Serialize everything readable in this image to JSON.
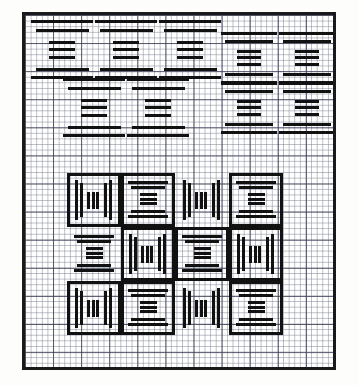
{
  "document": {
    "kind": "scanned-resolution-test-chart",
    "title": "Resolution Test Chart",
    "background_color": "#ffffff",
    "ink_color": "#111111",
    "paper": {
      "type": "graph-paper",
      "minor_grid_color": "#787d8c",
      "major_grid_color": "#3c4155",
      "minor_cell_px": 5.62,
      "major_cell_px": 28.1,
      "minor_per_major": 5
    },
    "frame": {
      "border_color": "#1a1a1a",
      "border_width_px": 3,
      "x": 22,
      "y": 12,
      "width": 314,
      "height": 358
    }
  },
  "chart_data": {
    "type": "table",
    "title": "Resolution Test Chart",
    "xlabel": "",
    "ylabel": "",
    "groups": [
      {
        "name": "upper-bar-field",
        "description": "Five I-beam bar targets arranged in an upper field; left cluster of three over two, right cluster of two tall stacked pairs.",
        "targets": [
          {
            "id": "T1",
            "orientation": "horizontal",
            "x": 6,
            "y": 4,
            "w": 62,
            "h": 64,
            "bars": 7
          },
          {
            "id": "T2",
            "orientation": "horizontal",
            "x": 70,
            "y": 4,
            "w": 62,
            "h": 64,
            "bars": 7
          },
          {
            "id": "T3",
            "orientation": "horizontal",
            "x": 134,
            "y": 4,
            "w": 62,
            "h": 64,
            "bars": 7
          },
          {
            "id": "T4",
            "orientation": "horizontal",
            "x": 38,
            "y": 62,
            "w": 62,
            "h": 64,
            "bars": 7
          },
          {
            "id": "T5",
            "orientation": "horizontal",
            "x": 102,
            "y": 62,
            "w": 62,
            "h": 64,
            "bars": 7
          },
          {
            "id": "T6",
            "orientation": "horizontal",
            "x": 196,
            "y": 16,
            "w": 56,
            "h": 56,
            "bars": 7
          },
          {
            "id": "T7",
            "orientation": "horizontal",
            "x": 254,
            "y": 16,
            "w": 56,
            "h": 56,
            "bars": 7
          },
          {
            "id": "T8",
            "orientation": "horizontal",
            "x": 196,
            "y": 66,
            "w": 56,
            "h": 56,
            "bars": 7
          },
          {
            "id": "T9",
            "orientation": "horizontal",
            "x": 254,
            "y": 66,
            "w": 56,
            "h": 56,
            "bars": 7
          }
        ]
      },
      {
        "name": "lower-checkerboard",
        "description": "Checkerboard of framed square cells, alternating vertical-bar and horizontal-bar I-beam targets.",
        "cell_px": 54,
        "origin": {
          "x": 42,
          "y": 158
        },
        "cells": [
          {
            "row": 0,
            "col": 0,
            "orientation": "vertical",
            "boxed": true,
            "bars": 7
          },
          {
            "row": 0,
            "col": 1,
            "orientation": "horizontal",
            "boxed": true,
            "bars": 7
          },
          {
            "row": 0,
            "col": 2,
            "orientation": "vertical",
            "boxed": false,
            "bars": 7
          },
          {
            "row": 0,
            "col": 3,
            "orientation": "horizontal",
            "boxed": true,
            "bars": 7
          },
          {
            "row": 1,
            "col": 0,
            "orientation": "horizontal",
            "boxed": false,
            "bars": 7
          },
          {
            "row": 1,
            "col": 1,
            "orientation": "vertical",
            "boxed": true,
            "bars": 7
          },
          {
            "row": 1,
            "col": 2,
            "orientation": "horizontal",
            "boxed": true,
            "bars": 7
          },
          {
            "row": 1,
            "col": 3,
            "orientation": "vertical",
            "boxed": true,
            "bars": 7
          },
          {
            "row": 2,
            "col": 0,
            "orientation": "vertical",
            "boxed": true,
            "bars": 7
          },
          {
            "row": 2,
            "col": 1,
            "orientation": "horizontal",
            "boxed": true,
            "bars": 7
          },
          {
            "row": 2,
            "col": 2,
            "orientation": "vertical",
            "boxed": false,
            "bars": 7
          },
          {
            "row": 2,
            "col": 3,
            "orientation": "horizontal",
            "boxed": true,
            "bars": 7
          }
        ]
      }
    ],
    "ibeam_profile": {
      "description": "Relative bar lengths (fraction of target width) from top to bottom of one I-beam element.",
      "lengths": [
        1.0,
        0.86,
        0.42,
        0.42,
        0.42,
        0.86,
        1.0
      ],
      "thicknesses": [
        3.0,
        3.0,
        2.6,
        2.6,
        2.6,
        3.0,
        3.2
      ]
    }
  }
}
